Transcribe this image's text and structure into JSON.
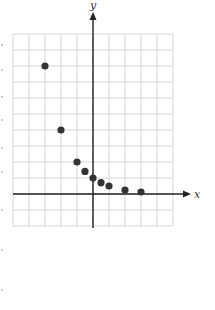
{
  "chart_data": {
    "type": "scatter",
    "title": "",
    "xlabel": "x",
    "ylabel": "y",
    "xlim": [
      -5,
      5
    ],
    "ylim": [
      -2,
      10
    ],
    "grid": true,
    "grid_step": 1,
    "tick_labels": false,
    "series": [
      {
        "name": "points",
        "color": "#333333",
        "x": [
          -3,
          -2,
          -1,
          -0.5,
          0,
          0.5,
          1,
          2,
          3
        ],
        "y": [
          8,
          4,
          2,
          1.41,
          1,
          0.71,
          0.5,
          0.25,
          0.125
        ]
      }
    ]
  }
}
